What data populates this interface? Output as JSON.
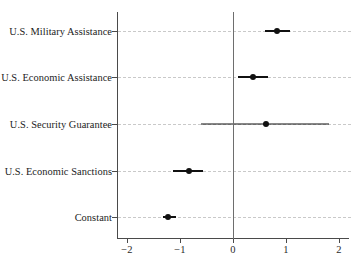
{
  "chart_data": {
    "type": "scatter",
    "title": "",
    "subtitle": "",
    "xlabel": "",
    "ylabel": "",
    "xlim": [
      -2.35,
      2.1
    ],
    "ylim": [
      0,
      5
    ],
    "grid": "horizontal-dashed",
    "legend": "none",
    "reference_line": 0,
    "xticks": [
      -2,
      -1,
      0,
      1,
      2
    ],
    "xtick_labels": [
      "−2",
      "−1",
      "0",
      "1",
      "2"
    ],
    "categories": [
      "U.S. Military Assistance",
      "U.S. Economic Assistance",
      "U.S. Security Guarantee",
      "U.S. Economic Sanctions",
      "Constant"
    ],
    "estimates": [
      0.83,
      0.38,
      0.62,
      -0.83,
      -1.22
    ],
    "ci_low": [
      0.6,
      0.09,
      -0.6,
      -1.13,
      -1.33
    ],
    "ci_high": [
      1.07,
      0.66,
      1.82,
      -0.56,
      -1.07
    ],
    "point_color": "#111111",
    "line_color": "#111111",
    "grid_color": "#c9c9c9",
    "axis_color": "#4a4a4a",
    "zero_line_color": "#6e6e6e",
    "background": "#ffffff"
  }
}
